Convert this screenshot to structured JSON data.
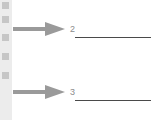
{
  "items": [
    {
      "number": "2",
      "arrow": "right-arrow-icon",
      "answer": ""
    },
    {
      "number": "3",
      "arrow": "right-arrow-icon",
      "answer": ""
    }
  ],
  "colors": {
    "arrow": "#9a9a9a",
    "strip": "#ececec",
    "line": "#4a4a4a",
    "number": "#8c8c8c"
  }
}
